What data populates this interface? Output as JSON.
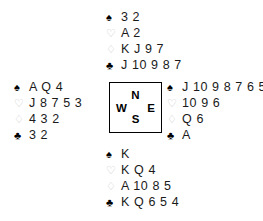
{
  "diagram": {
    "background_color": "#ffffff",
    "ink_color": "#000000",
    "outline_suit_color": "#c9c9c9"
  },
  "suits": {
    "spade": {
      "name": "spade-suit-symbol",
      "glyph": "♠",
      "style": "black"
    },
    "heart": {
      "name": "heart-suit-symbol",
      "glyph": "♡",
      "style": "outline"
    },
    "diamond": {
      "name": "diamond-suit-symbol",
      "glyph": "♢",
      "style": "outline"
    },
    "club": {
      "name": "club-suit-symbol",
      "glyph": "♣",
      "style": "black"
    }
  },
  "compass": {
    "north": "N",
    "east": "E",
    "south": "S",
    "west": "W"
  },
  "hands": {
    "north": {
      "position": "North",
      "spades": "3 2",
      "hearts": "A 2",
      "diamonds": "K J 9 7",
      "clubs": "J 10 9 8 7"
    },
    "west": {
      "position": "West",
      "spades": "A Q 4",
      "hearts": "J 8 7 5 3",
      "diamonds": "4 3 2",
      "clubs": "3 2"
    },
    "east": {
      "position": "East",
      "spades": "J 10 9 8 7 6 5",
      "hearts": "10 9 6",
      "diamonds": "Q 6",
      "clubs": "A"
    },
    "south": {
      "position": "South",
      "spades": "K",
      "hearts": "K Q 4",
      "diamonds": "A 10 8 5",
      "clubs": "K Q 6 5 4"
    }
  }
}
